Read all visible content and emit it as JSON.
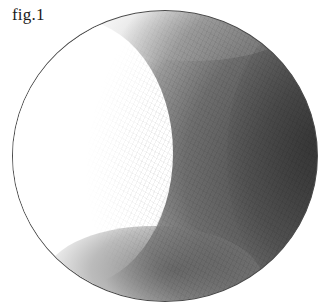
{
  "figure": {
    "label": "fig.1",
    "light_direction": "upper-left",
    "colors": {
      "background": "#ffffff",
      "outline": "#4a4a4a",
      "shadow_core": "#3e3e3e",
      "midtone": "#9a9a9a",
      "highlight": "#ffffff"
    }
  }
}
